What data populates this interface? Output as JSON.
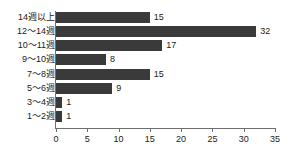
{
  "chart_data": {
    "type": "bar",
    "orientation": "horizontal",
    "title": "",
    "subtitle": "",
    "xlabel": "",
    "ylabel": "",
    "categories": [
      "14週以上",
      "12～14週",
      "10～11週",
      "9～10週",
      "7～8週",
      "5～6週",
      "3～4週",
      "1～2週"
    ],
    "values": [
      15,
      32,
      17,
      8,
      15,
      9,
      1,
      1
    ],
    "value_labels": [
      "15",
      "32",
      "17",
      "8",
      "15",
      "9",
      "1",
      "1"
    ],
    "xlim": [
      0,
      35
    ],
    "xticks": [
      0,
      5,
      10,
      15,
      20,
      25,
      30,
      35
    ],
    "xtick_labels": [
      "0",
      "5",
      "10",
      "15",
      "20",
      "25",
      "30",
      "35"
    ],
    "grid": false,
    "legend": false,
    "bar_color": "#3a3a3a",
    "axis_color": "#6e6e6e",
    "text_color": "#1a1a1a",
    "background_color": "#ffffff"
  }
}
